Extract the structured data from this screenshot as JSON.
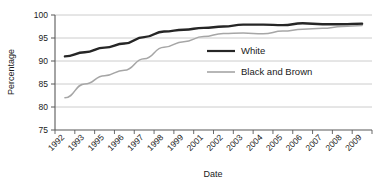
{
  "chart_data": {
    "type": "line",
    "title": "",
    "xlabel": "Date",
    "ylabel": "Percentage",
    "ylim": [
      75,
      100
    ],
    "yticks": [
      75,
      80,
      85,
      90,
      95,
      100
    ],
    "grid": true,
    "legend_position": "center-right-inside",
    "categories": [
      "1992",
      "1993",
      "1995",
      "1996",
      "1997",
      "1998",
      "1999",
      "2001",
      "2002",
      "2003",
      "2004",
      "2005",
      "2006",
      "2007",
      "2008",
      "2009"
    ],
    "series": [
      {
        "name": "White",
        "color": "#262626",
        "values": [
          91.0,
          91.9,
          92.9,
          93.8,
          95.2,
          96.4,
          96.8,
          97.2,
          97.5,
          97.9,
          97.9,
          97.8,
          98.2,
          98.0,
          98.0,
          98.1
        ]
      },
      {
        "name": "Black and Brown",
        "color": "#a6a6a6",
        "values": [
          82.0,
          85.0,
          86.8,
          88.0,
          90.5,
          93.0,
          94.2,
          95.3,
          96.0,
          96.1,
          95.9,
          96.5,
          96.9,
          97.1,
          97.5,
          97.7
        ]
      }
    ]
  },
  "legend": {
    "items": [
      {
        "label": "White",
        "color": "#262626"
      },
      {
        "label": "Black and Brown",
        "color": "#a6a6a6"
      }
    ]
  },
  "axes": {
    "y_title": "Percentage",
    "x_title": "Date",
    "y_tick_labels": [
      "100",
      "95",
      "90",
      "85",
      "80",
      "75"
    ],
    "x_tick_labels": [
      "1992",
      "1993",
      "1995",
      "1996",
      "1997",
      "1998",
      "1999",
      "2001",
      "2002",
      "2003",
      "2004",
      "2005",
      "2006",
      "2007",
      "2008",
      "2009"
    ]
  },
  "colors": {
    "axis": "#595959",
    "grid": "#bfbfbf",
    "series_white": "#262626",
    "series_black_brown": "#a6a6a6",
    "text": "#1a1a1a"
  }
}
